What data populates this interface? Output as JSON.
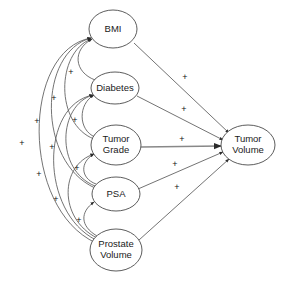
{
  "diagram": {
    "type": "path-diagram",
    "title": "",
    "nodes": [
      {
        "id": "bmi",
        "label": "BMI",
        "lines": [
          "BMI"
        ],
        "cx": 113,
        "cy": 29,
        "rx": 24,
        "ry": 19
      },
      {
        "id": "diabetes",
        "label": "Diabetes",
        "lines": [
          "Diabetes"
        ],
        "cx": 115,
        "cy": 88,
        "rx": 24,
        "ry": 16
      },
      {
        "id": "grade",
        "label": "Tumor Grade",
        "lines": [
          "Tumor",
          "Grade"
        ],
        "cx": 116,
        "cy": 145,
        "rx": 25,
        "ry": 20
      },
      {
        "id": "psa",
        "label": "PSA",
        "lines": [
          "PSA"
        ],
        "cx": 116,
        "cy": 194,
        "rx": 24,
        "ry": 17
      },
      {
        "id": "prostate",
        "label": "Prostate Volume",
        "lines": [
          "Prostate",
          "Volume"
        ],
        "cx": 116,
        "cy": 250,
        "rx": 26,
        "ry": 21
      },
      {
        "id": "tumorvol",
        "label": "Tumor Volume",
        "lines": [
          "Tumor",
          "Volume"
        ],
        "cx": 248,
        "cy": 145,
        "rx": 27,
        "ry": 20
      }
    ],
    "edges": [
      {
        "from": "bmi",
        "to": "tumorvol",
        "sign": "+",
        "sign_x": 185,
        "sign_y": 78,
        "path": "M 134 43 L 229 133"
      },
      {
        "from": "diabetes",
        "to": "tumorvol",
        "sign": "+",
        "sign_x": 184,
        "sign_y": 110,
        "path": "M 137 96 L 223 140"
      },
      {
        "from": "grade",
        "to": "tumorvol",
        "sign": "+",
        "sign_x": 182,
        "sign_y": 140,
        "path": "M 141 147 L 221 146",
        "style": "thick"
      },
      {
        "from": "psa",
        "to": "tumorvol",
        "sign": "+",
        "sign_x": 175,
        "sign_y": 165,
        "path": "M 138 189 L 223 152"
      },
      {
        "from": "prostate",
        "to": "tumorvol",
        "sign": "+",
        "sign_x": 177,
        "sign_y": 188,
        "path": "M 139 240 L 229 159"
      },
      {
        "from": "diabetes",
        "to": "bmi",
        "sign": "+",
        "sign_x": 71,
        "sign_y": 73,
        "path": "M 95 80 C 74 72 72 50 92 39"
      },
      {
        "from": "grade",
        "to": "bmi",
        "sign": "+",
        "sign_x": 54,
        "sign_y": 99,
        "path": "M 94 139 C 55 124 56 53 91 39"
      },
      {
        "from": "psa",
        "to": "bmi",
        "sign": "+",
        "sign_x": 37,
        "sign_y": 122,
        "path": "M 95 188 C 37 162 38 52 91 38"
      },
      {
        "from": "prostate",
        "to": "bmi",
        "sign": "+",
        "sign_x": 22,
        "sign_y": 144,
        "path": "M 96 243 C 20 208 22 50 91 38"
      },
      {
        "from": "grade",
        "to": "diabetes",
        "sign": "+",
        "sign_x": 75,
        "sign_y": 121,
        "path": "M 95 137 C 78 130 78 104 94 95"
      },
      {
        "from": "psa",
        "to": "diabetes",
        "sign": "+",
        "sign_x": 52,
        "sign_y": 148,
        "path": "M 95 186 C 55 170 58 105 93 95"
      },
      {
        "from": "prostate",
        "to": "diabetes",
        "sign": "+",
        "sign_x": 39,
        "sign_y": 175,
        "path": "M 96 240 C 40 212 40 105 93 95"
      },
      {
        "from": "psa",
        "to": "grade",
        "sign": "+",
        "sign_x": 77,
        "sign_y": 169,
        "path": "M 96 184 C 80 178 80 162 94 154"
      },
      {
        "from": "prostate",
        "to": "grade",
        "sign": "+",
        "sign_x": 56,
        "sign_y": 200,
        "path": "M 97 238 C 58 218 60 165 94 154"
      },
      {
        "from": "prostate",
        "to": "psa",
        "sign": "+",
        "sign_x": 79,
        "sign_y": 221,
        "path": "M 97 236 C 80 226 80 212 94 202"
      }
    ],
    "sign_positive": "+"
  }
}
